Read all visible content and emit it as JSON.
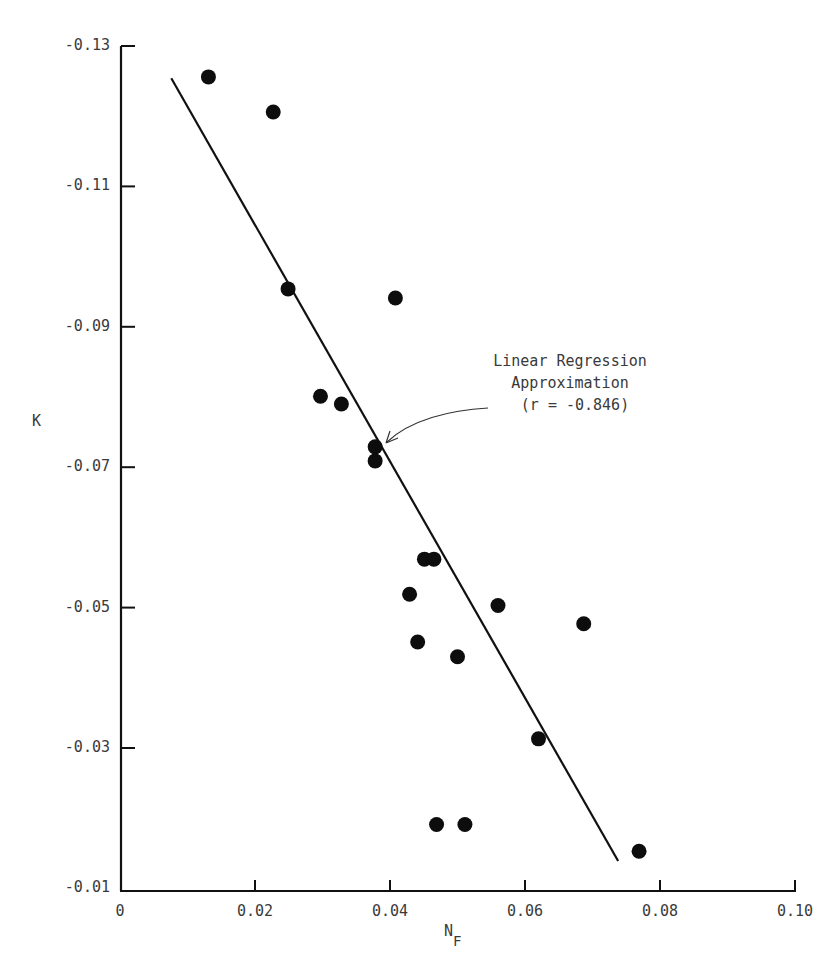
{
  "chart_data": {
    "type": "scatter",
    "title": "",
    "xlabel": "N_F",
    "xlabel_main": "N",
    "xlabel_sub": "F",
    "ylabel": "K",
    "xlim": [
      0,
      0.1
    ],
    "ylim": [
      -0.01,
      -0.13
    ],
    "x_ticks": [
      "0",
      "0.02",
      "0.04",
      "0.06",
      "0.08",
      "0.10"
    ],
    "x_tick_values": [
      0,
      0.02,
      0.04,
      0.06,
      0.08,
      0.1
    ],
    "y_ticks": [
      "-0.13",
      "-0.11",
      "-0.09",
      "-0.07",
      "-0.05",
      "-0.03",
      "-0.01"
    ],
    "y_tick_values": [
      -0.13,
      -0.11,
      -0.09,
      -0.07,
      -0.05,
      -0.03,
      -0.01
    ],
    "grid": false,
    "legend": null,
    "series": [
      {
        "name": "Observations",
        "type": "scatter",
        "points": [
          {
            "x": 0.0131,
            "y": -0.1256
          },
          {
            "x": 0.0227,
            "y": -0.1206
          },
          {
            "x": 0.0249,
            "y": -0.0954
          },
          {
            "x": 0.0408,
            "y": -0.0941
          },
          {
            "x": 0.0297,
            "y": -0.0801
          },
          {
            "x": 0.0328,
            "y": -0.079
          },
          {
            "x": 0.0378,
            "y": -0.0729
          },
          {
            "x": 0.0378,
            "y": -0.0709
          },
          {
            "x": 0.0451,
            "y": -0.0569
          },
          {
            "x": 0.0465,
            "y": -0.0569
          },
          {
            "x": 0.0429,
            "y": -0.0519
          },
          {
            "x": 0.056,
            "y": -0.0503
          },
          {
            "x": 0.0687,
            "y": -0.0477
          },
          {
            "x": 0.0441,
            "y": -0.0451
          },
          {
            "x": 0.05,
            "y": -0.043
          },
          {
            "x": 0.062,
            "y": -0.0313
          },
          {
            "x": 0.0469,
            "y": -0.0191
          },
          {
            "x": 0.0511,
            "y": -0.0191
          },
          {
            "x": 0.0769,
            "y": -0.0153
          }
        ]
      },
      {
        "name": "Linear Regression Approximation",
        "type": "line",
        "points": [
          {
            "x": 0.0076,
            "y": -0.1254
          },
          {
            "x": 0.0738,
            "y": -0.0139
          }
        ]
      }
    ],
    "annotations": [
      {
        "lines": [
          "Linear Regression",
          "Approximation",
          "(r = -0.846)"
        ],
        "arrow_to": {
          "x": 0.0395,
          "y": -0.0729
        }
      }
    ]
  },
  "annotation": {
    "line1": "Linear Regression",
    "line2": "Approximation",
    "line3": "(r = -0.846)"
  },
  "axes": {
    "y_label": "K",
    "x_label_main": "N",
    "x_label_sub": "F",
    "y_ticks": [
      "-0.13",
      "-0.11",
      "-0.09",
      "-0.07",
      "-0.05",
      "-0.03",
      "-0.01"
    ],
    "x_ticks": [
      "0",
      "0.02",
      "0.04",
      "0.06",
      "0.08",
      "0.10"
    ]
  },
  "style": {
    "ink": "#111111",
    "text": "#3a3a3a",
    "background": "#ffffff"
  }
}
